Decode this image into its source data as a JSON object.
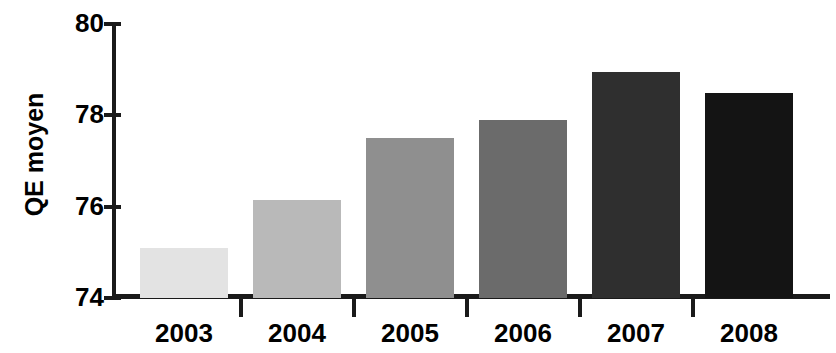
{
  "chart_data": {
    "type": "bar",
    "title": "",
    "xlabel": "",
    "ylabel": "QE moyen",
    "categories": [
      "2003",
      "2004",
      "2005",
      "2006",
      "2007",
      "2008"
    ],
    "values": [
      75.1,
      76.15,
      77.5,
      77.9,
      78.95,
      78.5
    ],
    "ylim": [
      74,
      80
    ],
    "yticks": [
      74,
      76,
      78,
      80
    ],
    "ytick_labels": [
      "74",
      "76",
      "78",
      "80"
    ],
    "grid": false,
    "legend": false,
    "bar_colors": [
      "#e3e3e3",
      "#b9b9b9",
      "#8f8f8f",
      "#6b6b6b",
      "#2f2f2f",
      "#141414"
    ]
  },
  "axes": {
    "y_title": "QE moyen",
    "axis_color": "#1a1a1a"
  }
}
